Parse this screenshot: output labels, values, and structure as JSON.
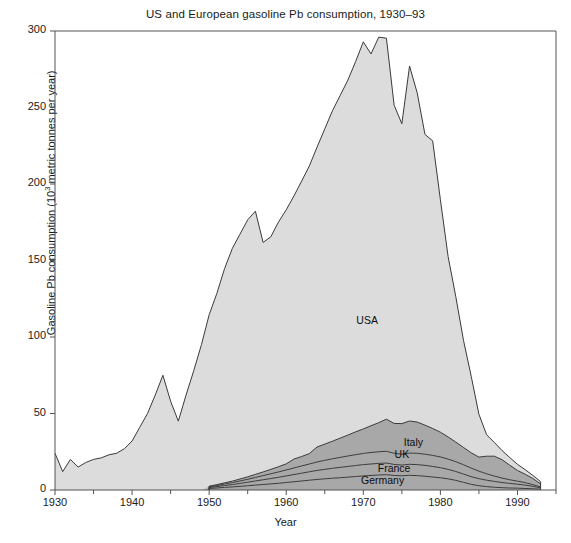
{
  "chart_data": {
    "type": "area",
    "stacked": true,
    "title": "US and European gasoline Pb consumption, 1930–93",
    "xlabel": "Year",
    "ylabel_text": "Gasoline Pb consumption (10",
    "ylabel_sup": "3",
    "ylabel_tail": " metric tonnes per year)",
    "ylabel_full": "Gasoline Pb consumption (10^3 metric tonnes per year)",
    "xlim": [
      1930,
      1995
    ],
    "ylim": [
      0,
      300
    ],
    "xticks": [
      1930,
      1940,
      1950,
      1960,
      1970,
      1980,
      1990
    ],
    "xtick_labels": [
      "1930",
      "1940",
      "1950",
      "1960",
      "1970",
      "1980",
      "1990"
    ],
    "yticks": [
      0,
      50,
      100,
      150,
      200,
      250,
      300
    ],
    "ytick_labels": [
      "0",
      "50",
      "100",
      "150",
      "200",
      "250",
      "300"
    ],
    "grid": false,
    "legend": "inline-area-labels",
    "colors": {
      "usa_fill": "#dcdcdc",
      "europe_fill": "#a8a8a8",
      "line": "#3a3a3a",
      "axis": "#555555",
      "text": "#1a1a1a",
      "background": "#ffffff"
    },
    "annotations": [
      {
        "label": "USA",
        "x": 1970.5,
        "y": 110
      },
      {
        "label": "Italy",
        "x": 1976.5,
        "y": 30
      },
      {
        "label": "UK",
        "x": 1975.0,
        "y": 22
      },
      {
        "label": "France",
        "x": 1974.0,
        "y": 13
      },
      {
        "label": "Germany",
        "x": 1972.5,
        "y": 5
      }
    ],
    "x": [
      1930,
      1931,
      1932,
      1933,
      1934,
      1935,
      1936,
      1937,
      1938,
      1939,
      1940,
      1941,
      1942,
      1943,
      1944,
      1945,
      1946,
      1947,
      1948,
      1949,
      1950,
      1951,
      1952,
      1953,
      1954,
      1955,
      1956,
      1957,
      1958,
      1959,
      1960,
      1961,
      1962,
      1963,
      1964,
      1965,
      1966,
      1967,
      1968,
      1969,
      1970,
      1971,
      1972,
      1973,
      1974,
      1975,
      1976,
      1977,
      1978,
      1979,
      1980,
      1981,
      1982,
      1983,
      1984,
      1985,
      1986,
      1987,
      1988,
      1989,
      1990,
      1991,
      1992,
      1993
    ],
    "series": [
      {
        "name": "Germany",
        "values": [
          0,
          0,
          0,
          0,
          0,
          0,
          0,
          0,
          0,
          0,
          0,
          0,
          0,
          0,
          0,
          0,
          0,
          0,
          0,
          0,
          1.0,
          1.3,
          1.7,
          2.0,
          2.4,
          2.8,
          3.2,
          3.6,
          4.0,
          4.4,
          4.9,
          5.4,
          5.9,
          6.4,
          6.9,
          7.3,
          7.7,
          8.0,
          8.4,
          8.8,
          9.2,
          9.5,
          9.8,
          10.0,
          9.5,
          9.3,
          9.6,
          9.4,
          9.0,
          8.5,
          8.0,
          7.3,
          6.3,
          5.0,
          3.7,
          2.8,
          2.2,
          1.8,
          1.5,
          1.3,
          1.2,
          1.0,
          0.8,
          0.5
        ]
      },
      {
        "name": "France",
        "values": [
          0,
          0,
          0,
          0,
          0,
          0,
          0,
          0,
          0,
          0,
          0,
          0,
          0,
          0,
          0,
          0,
          0,
          0,
          0,
          0,
          0.6,
          0.9,
          1.2,
          1.5,
          1.9,
          2.3,
          2.7,
          3.1,
          3.5,
          3.9,
          4.3,
          4.7,
          5.1,
          5.5,
          5.9,
          6.2,
          6.5,
          6.8,
          7.0,
          7.2,
          7.4,
          7.5,
          7.6,
          7.6,
          7.2,
          7.0,
          7.2,
          7.2,
          7.1,
          6.9,
          6.6,
          6.2,
          5.8,
          5.4,
          5.0,
          4.6,
          4.2,
          3.8,
          3.4,
          3.0,
          2.6,
          2.2,
          1.6,
          0.9
        ]
      },
      {
        "name": "UK",
        "values": [
          0,
          0,
          0,
          0,
          0,
          0,
          0,
          0,
          0,
          0,
          0,
          0,
          0,
          0,
          0,
          0,
          0,
          0,
          0,
          0,
          0.5,
          0.7,
          1.0,
          1.3,
          1.6,
          1.9,
          2.3,
          2.7,
          3.1,
          3.5,
          3.9,
          4.3,
          4.7,
          5.1,
          5.5,
          5.9,
          6.2,
          6.5,
          6.8,
          7.1,
          7.3,
          7.5,
          7.6,
          7.7,
          7.3,
          7.1,
          7.3,
          7.4,
          7.3,
          7.2,
          7.0,
          6.7,
          6.4,
          6.1,
          5.6,
          4.9,
          4.2,
          3.5,
          2.9,
          2.4,
          2.0,
          1.6,
          1.1,
          0.6
        ]
      },
      {
        "name": "Italy",
        "values": [
          0,
          0,
          0,
          0,
          0,
          0,
          0,
          0,
          0,
          0,
          0,
          0,
          0,
          0,
          0,
          0,
          0,
          0,
          0,
          0,
          0.4,
          0.6,
          0.8,
          1.0,
          1.3,
          1.6,
          2.0,
          2.4,
          2.9,
          3.4,
          4.0,
          5.8,
          6.2,
          6.8,
          9.8,
          10.6,
          11.5,
          12.6,
          13.7,
          14.9,
          16.0,
          17.5,
          19.0,
          21.0,
          19.5,
          20.0,
          21.0,
          20.4,
          19.0,
          17.6,
          16.2,
          14.5,
          12.8,
          11.3,
          10.0,
          9.2,
          11.5,
          13.0,
          12.0,
          9.5,
          7.0,
          5.5,
          4.0,
          2.0
        ]
      },
      {
        "name": "USA",
        "values": [
          24,
          12,
          20,
          15,
          18,
          20,
          21,
          23,
          24,
          27,
          32,
          41,
          50,
          62,
          75,
          58,
          45,
          62,
          78,
          95,
          112,
          125,
          140,
          152,
          160,
          168,
          172,
          150,
          152,
          160,
          166,
          172,
          180,
          188,
          196,
          206,
          216,
          224,
          232,
          242,
          253,
          243,
          252,
          249,
          208,
          196,
          232,
          215,
          190,
          188,
          152,
          118,
          95,
          70,
          50,
          28,
          14,
          9,
          6,
          5,
          4,
          3,
          2,
          1.5
        ]
      }
    ]
  }
}
